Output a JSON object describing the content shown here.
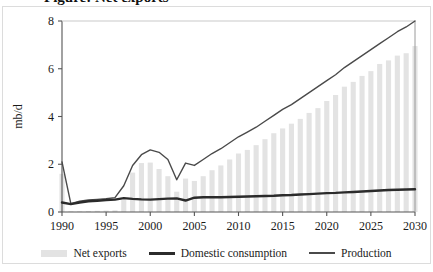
{
  "figure": {
    "title_partial": "Figure: Net exports",
    "frame_color": "#dcdcdc",
    "background": "#ffffff"
  },
  "chart_data": {
    "type": "bar",
    "title": "",
    "xlabel": "",
    "ylabel": "mb/d",
    "xlim": [
      1990,
      2030
    ],
    "ylim": [
      0,
      8
    ],
    "ytick_labels": [
      "0",
      "2",
      "4",
      "6",
      "8"
    ],
    "yticks": [
      0,
      2,
      4,
      6,
      8
    ],
    "xtick_labels": [
      "1990",
      "1995",
      "2000",
      "2005",
      "2010",
      "2015",
      "2020",
      "2025",
      "2030"
    ],
    "xticks": [
      1990,
      1995,
      2000,
      2005,
      2010,
      2015,
      2020,
      2025,
      2030
    ],
    "grid": false,
    "legend_position": "bottom",
    "colors": {
      "net_exports": "#e3e3e3",
      "domestic_consumption": "#2b2b2b",
      "production": "#4a4a4a",
      "axis": "#555555"
    },
    "x": [
      1990,
      1991,
      1992,
      1993,
      1994,
      1995,
      1996,
      1997,
      1998,
      1999,
      2000,
      2001,
      2002,
      2003,
      2004,
      2005,
      2006,
      2007,
      2008,
      2009,
      2010,
      2011,
      2012,
      2013,
      2014,
      2015,
      2016,
      2017,
      2018,
      2019,
      2020,
      2021,
      2022,
      2023,
      2024,
      2025,
      2026,
      2027,
      2028,
      2029,
      2030
    ],
    "series": [
      {
        "name": "Net exports",
        "type": "bar",
        "values": [
          1.6,
          0.03,
          0.03,
          0.04,
          0.05,
          0.06,
          0.07,
          0.5,
          1.65,
          2.05,
          2.07,
          1.8,
          1.5,
          0.85,
          1.4,
          1.3,
          1.5,
          1.75,
          1.95,
          2.2,
          2.45,
          2.6,
          2.8,
          3.05,
          3.3,
          3.5,
          3.7,
          3.9,
          4.15,
          4.35,
          4.65,
          4.9,
          5.25,
          5.45,
          5.7,
          5.9,
          6.2,
          6.35,
          6.55,
          6.65,
          6.95
        ]
      },
      {
        "name": "Domestic consumption",
        "type": "line",
        "values": [
          0.4,
          0.33,
          0.4,
          0.45,
          0.47,
          0.5,
          0.52,
          0.58,
          0.55,
          0.53,
          0.52,
          0.54,
          0.56,
          0.57,
          0.48,
          0.6,
          0.62,
          0.62,
          0.62,
          0.63,
          0.64,
          0.65,
          0.66,
          0.67,
          0.68,
          0.7,
          0.71,
          0.73,
          0.75,
          0.77,
          0.79,
          0.8,
          0.82,
          0.84,
          0.86,
          0.88,
          0.9,
          0.92,
          0.93,
          0.94,
          0.95
        ]
      },
      {
        "name": "Production",
        "type": "line",
        "values": [
          2.1,
          0.35,
          0.45,
          0.5,
          0.53,
          0.56,
          0.6,
          1.1,
          1.95,
          2.4,
          2.6,
          2.5,
          2.2,
          1.35,
          2.05,
          1.95,
          2.2,
          2.45,
          2.65,
          2.9,
          3.15,
          3.35,
          3.55,
          3.8,
          4.05,
          4.3,
          4.5,
          4.75,
          5.0,
          5.25,
          5.5,
          5.75,
          6.05,
          6.3,
          6.55,
          6.8,
          7.05,
          7.3,
          7.55,
          7.75,
          8.0
        ]
      }
    ]
  },
  "legend": {
    "items": [
      {
        "label": "Net exports",
        "marker": "bar-swatch"
      },
      {
        "label": "Domestic consumption",
        "marker": "thick-line-swatch"
      },
      {
        "label": "Production",
        "marker": "thin-line-swatch"
      }
    ]
  }
}
